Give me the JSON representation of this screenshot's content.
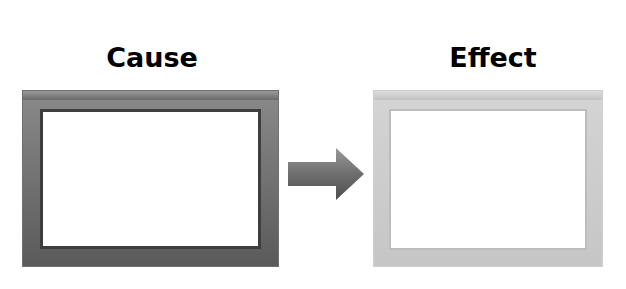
{
  "diagram": {
    "cause": {
      "label": "Cause",
      "frame_color": "#5f5f5f"
    },
    "effect": {
      "label": "Effect",
      "frame_color": "#c8c8c8"
    },
    "connector": {
      "icon": "right-arrow-icon",
      "color": "#666666"
    }
  }
}
